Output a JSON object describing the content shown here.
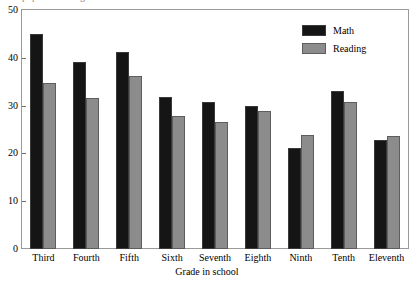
{
  "top_caption_clipped": "pupils in each grade",
  "chart_data": {
    "type": "bar",
    "title": "",
    "xlabel": "Grade in school",
    "ylabel": "",
    "categories": [
      "Third",
      "Fourth",
      "Fifth",
      "Sixth",
      "Seventh",
      "Eighth",
      "Ninth",
      "Tenth",
      "Eleventh"
    ],
    "series": [
      {
        "name": "Math",
        "color": "#151515",
        "values": [
          45.0,
          39.2,
          41.2,
          31.7,
          30.8,
          29.9,
          21.1,
          33.1,
          22.8
        ]
      },
      {
        "name": "Reading",
        "color": "#8c8c8c",
        "values": [
          34.8,
          31.5,
          36.1,
          27.8,
          26.6,
          28.8,
          23.8,
          30.7,
          23.7
        ]
      }
    ],
    "ylim": [
      0,
      50
    ],
    "yticks": [
      0,
      10,
      20,
      30,
      40,
      50
    ],
    "ytick_labels": [
      "0",
      "10",
      "20",
      "30",
      "40",
      "50"
    ],
    "grid": false,
    "legend_position": "top-right",
    "legend_entries": [
      "Math",
      "Reading"
    ]
  },
  "legend": {
    "items": [
      {
        "label": "Math",
        "swatch": "math"
      },
      {
        "label": "Reading",
        "swatch": "reading"
      }
    ]
  }
}
